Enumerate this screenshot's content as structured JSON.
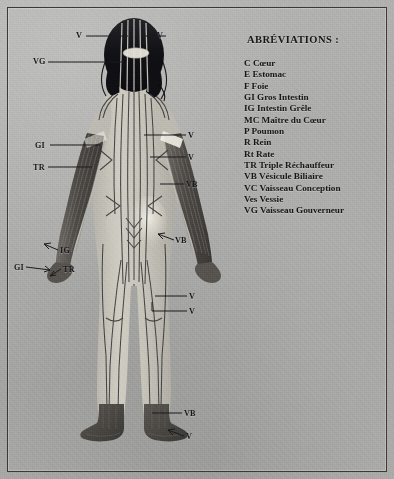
{
  "plate": {
    "title": "Meridiens - vue posterieure",
    "background_color": "#acacaa",
    "frame_color": "#3a3a38"
  },
  "abbreviations": {
    "heading": "ABRÉVIATIONS :",
    "items": [
      "C Cœur",
      "E Estomac",
      "F Foie",
      "GI Gros Intestin",
      "IG Intestin Grêle",
      "MC Maître du Cœur",
      "P Poumon",
      "R Rein",
      "Rt Rate",
      "TR Triple Réchauffeur",
      "VB Vésicule Biliaire",
      "VC Vaisseau Conception",
      "Ves Vessie",
      "VG Vaisseau Gouverneur"
    ]
  },
  "callouts": [
    {
      "id": "v-head-left",
      "label": "V",
      "x": 76,
      "y": 31
    },
    {
      "id": "v-head-right",
      "label": "V",
      "x": 157,
      "y": 31
    },
    {
      "id": "vg-head",
      "label": "VG",
      "x": 33,
      "y": 57
    },
    {
      "id": "gi-forearm",
      "label": "GI",
      "x": 35,
      "y": 141
    },
    {
      "id": "tr-forearm",
      "label": "TR",
      "x": 33,
      "y": 163
    },
    {
      "id": "v-shoulder",
      "label": "V",
      "x": 188,
      "y": 131
    },
    {
      "id": "v-upperback",
      "label": "V",
      "x": 188,
      "y": 153
    },
    {
      "id": "vb-arm",
      "label": "VB",
      "x": 186,
      "y": 180
    },
    {
      "id": "vb-hip",
      "label": "VB",
      "x": 175,
      "y": 236
    },
    {
      "id": "ig-hand",
      "label": "IG",
      "x": 60,
      "y": 246
    },
    {
      "id": "gi-hand",
      "label": "GI",
      "x": 14,
      "y": 263
    },
    {
      "id": "tr-hand",
      "label": "TR",
      "x": 63,
      "y": 265
    },
    {
      "id": "v-thigh",
      "label": "V",
      "x": 189,
      "y": 292
    },
    {
      "id": "v-knee",
      "label": "V",
      "x": 189,
      "y": 307
    },
    {
      "id": "vb-ankle",
      "label": "VB",
      "x": 184,
      "y": 409
    },
    {
      "id": "v-foot",
      "label": "V",
      "x": 186,
      "y": 432
    }
  ],
  "figure": {
    "view": "posterior",
    "skin_color": "#c9c6bc",
    "hair_color": "#16161a",
    "meridian_line_color": "#3b3b3d",
    "forearm_shading": "#4a4845",
    "foot_shading": "#43413e"
  }
}
